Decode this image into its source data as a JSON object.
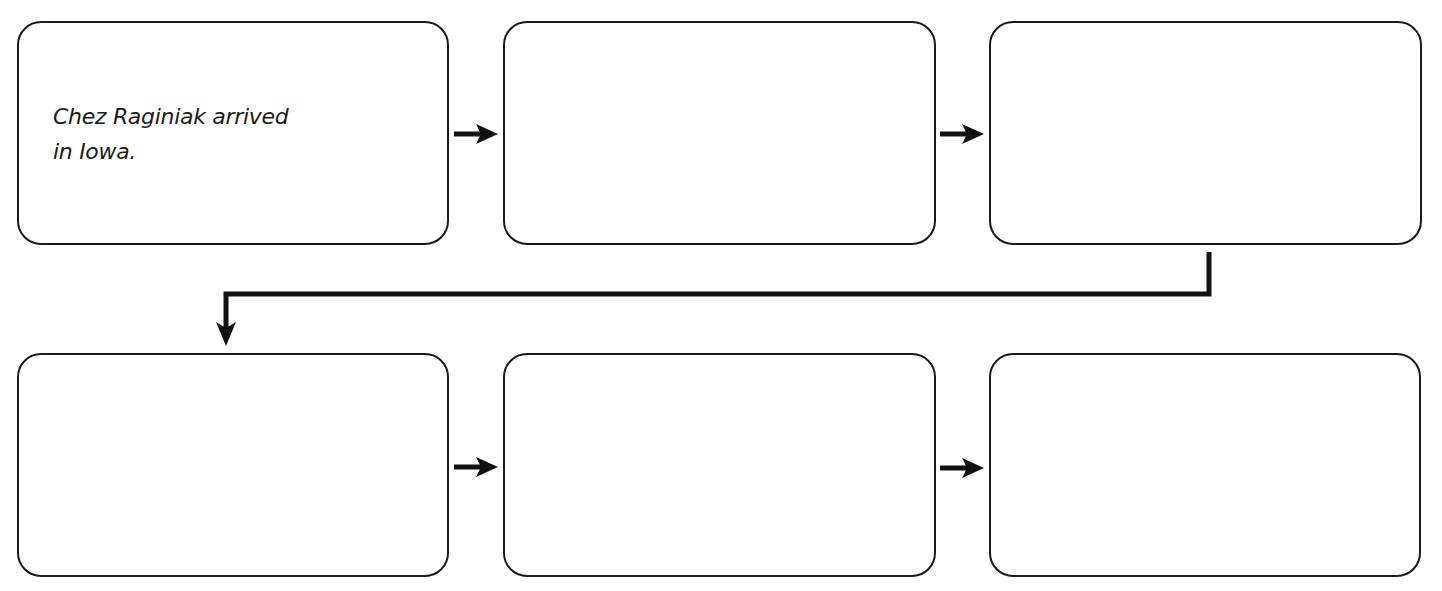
{
  "diagram": {
    "type": "sequence-flowchart",
    "rows": 2,
    "boxes": [
      {
        "id": "box-1",
        "row": 1,
        "col": 1,
        "text": "Chez Raginiak arrived\nin Iowa."
      },
      {
        "id": "box-2",
        "row": 1,
        "col": 2,
        "text": ""
      },
      {
        "id": "box-3",
        "row": 1,
        "col": 3,
        "text": ""
      },
      {
        "id": "box-4",
        "row": 2,
        "col": 1,
        "text": ""
      },
      {
        "id": "box-5",
        "row": 2,
        "col": 2,
        "text": ""
      },
      {
        "id": "box-6",
        "row": 2,
        "col": 3,
        "text": ""
      }
    ],
    "arrows": [
      {
        "from": "box-1",
        "to": "box-2",
        "direction": "right"
      },
      {
        "from": "box-2",
        "to": "box-3",
        "direction": "right"
      },
      {
        "from": "box-3",
        "to": "box-4",
        "direction": "down-left-down"
      },
      {
        "from": "box-4",
        "to": "box-5",
        "direction": "right"
      },
      {
        "from": "box-5",
        "to": "box-6",
        "direction": "right"
      }
    ],
    "colors": {
      "stroke": "#1a1a1a",
      "background": "#ffffff"
    }
  }
}
